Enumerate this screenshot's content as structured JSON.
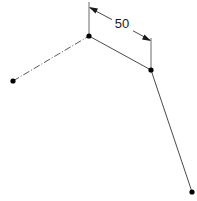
{
  "canvas": {
    "width": 197,
    "height": 201,
    "background": "#ffffff",
    "title": "Dimensioned Polyline Sketch"
  },
  "style": {
    "line_color": "#4a4a4a",
    "center_line_color": "#5a5a5a",
    "extension_line_color": "#6a6a6a",
    "dimension_line_color": "#4a4a4a",
    "arrow_color": "#1a1a1a",
    "node_color": "#000000",
    "text_color": "#1a1a1a"
  },
  "nodes": [
    {
      "id": "left-end",
      "name": "left-endpoint-node",
      "x": 13,
      "y": 81,
      "radius": 2.6
    },
    {
      "id": "apex",
      "name": "apex-vertex-node",
      "x": 89,
      "y": 36,
      "radius": 2.6
    },
    {
      "id": "knee",
      "name": "right-bend-node",
      "x": 151,
      "y": 70,
      "radius": 2.6
    },
    {
      "id": "bottom-end",
      "name": "bottom-endpoint-node",
      "x": 192,
      "y": 192,
      "radius": 2.6
    }
  ],
  "segments": [
    {
      "id": "seg-left",
      "name": "left-center-line-segment",
      "style": "dash-dot",
      "x1": 13,
      "y1": 81,
      "x2": 89,
      "y2": 36
    },
    {
      "id": "seg-top",
      "name": "upper-solid-segment",
      "style": "solid",
      "x1": 89,
      "y1": 36,
      "x2": 151,
      "y2": 70
    },
    {
      "id": "seg-right",
      "name": "lower-right-solid-segment",
      "style": "solid",
      "x1": 151,
      "y1": 70,
      "x2": 192,
      "y2": 192
    }
  ],
  "extension_lines": [
    {
      "id": "ext-left",
      "name": "left-extension-line",
      "x1": 89,
      "y1": 2,
      "x2": 89,
      "y2": 36
    },
    {
      "id": "ext-right",
      "name": "right-extension-line",
      "x1": 151,
      "y1": 38,
      "x2": 151,
      "y2": 71
    }
  ],
  "dimension": {
    "id": "dim-50",
    "name": "dimension-50",
    "label": "50",
    "value": 50,
    "text_x": 122,
    "text_y": 25,
    "line_start": {
      "x": 90,
      "y": 8
    },
    "line_end": {
      "x": 150,
      "y": 40
    },
    "gap_start": {
      "x": 112,
      "y": 19.6
    },
    "gap_end": {
      "x": 133,
      "y": 30.8
    },
    "arrow_start": {
      "name": "dimension-arrow-start",
      "points": "89,7 98,8.5 95.5,13.5"
    },
    "arrow_end": {
      "name": "dimension-arrow-end",
      "points": "151,41 142,39.5 144.5,34.5"
    }
  }
}
